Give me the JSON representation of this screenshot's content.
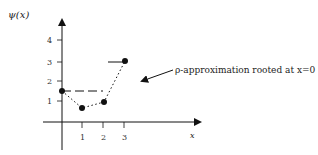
{
  "diagram": {
    "y_axis_label": "ψ(x)",
    "x_axis_label": "x",
    "x_ticks": [
      "1",
      "2",
      "3"
    ],
    "y_ticks": [
      "1",
      "2",
      "3",
      "4"
    ],
    "annotation": "ρ-approximation rooted at x=0",
    "points": [
      {
        "x": 0,
        "y": 1.5
      },
      {
        "x": 1,
        "y": 0.6
      },
      {
        "x": 2,
        "y": 1.0
      },
      {
        "x": 3,
        "y": 3.0
      }
    ],
    "dashed_segment": {
      "from_x": 0,
      "to_x": 2,
      "y": 1.5
    },
    "solid_segment": {
      "from_x": 2.2,
      "to_x": 3,
      "y": 3.0
    },
    "colors": {
      "ink": "#111111",
      "background": "#ffffff"
    }
  }
}
